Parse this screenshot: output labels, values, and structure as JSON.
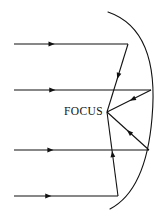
{
  "figure": {
    "background_color": "#ffffff",
    "stroke_color": "#111111",
    "width": 166,
    "height": 219,
    "label": {
      "text": "FOCUS",
      "x": 103,
      "y": 112
    },
    "focus_point": {
      "x": 107,
      "y": 112
    },
    "mirror": {
      "name": "parabola-mirror",
      "vertex": {
        "x": 152,
        "y": 118
      },
      "top_end": {
        "x": 108,
        "y": 12
      },
      "bottom_end": {
        "x": 110,
        "y": 209
      },
      "path": "M 108 12 Q 160 30 152 118 Q 146 190 110 209"
    },
    "incoming_rays": [
      {
        "name": "incoming-ray-1",
        "x1": 14,
        "y1": 44,
        "x2": 128,
        "y2": 44,
        "arrow_t": 0.33
      },
      {
        "name": "incoming-ray-2",
        "x1": 14,
        "y1": 90,
        "x2": 151,
        "y2": 90,
        "arrow_t": 0.28
      },
      {
        "name": "incoming-ray-3",
        "x1": 14,
        "y1": 150,
        "x2": 149,
        "y2": 150,
        "arrow_t": 0.27
      },
      {
        "name": "incoming-ray-4",
        "x1": 14,
        "y1": 196,
        "x2": 118,
        "y2": 196,
        "arrow_t": 0.33
      }
    ],
    "reflected_rays": [
      {
        "name": "reflected-ray-1",
        "x1": 128,
        "y1": 44,
        "x2": 107,
        "y2": 112,
        "arrow_t": 0.47
      },
      {
        "name": "reflected-ray-2",
        "x1": 151,
        "y1": 90,
        "x2": 107,
        "y2": 112,
        "arrow_t": 0.42
      },
      {
        "name": "reflected-ray-3",
        "x1": 149,
        "y1": 150,
        "x2": 107,
        "y2": 112,
        "arrow_t": 0.47
      },
      {
        "name": "reflected-ray-4",
        "x1": 118,
        "y1": 196,
        "x2": 107,
        "y2": 112,
        "arrow_t": 0.5
      }
    ]
  }
}
